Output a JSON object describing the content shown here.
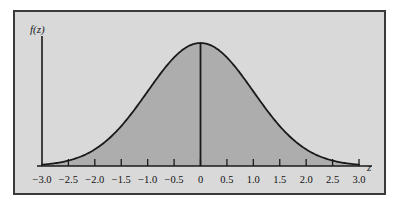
{
  "figure": {
    "background_color": "#d9d9d9",
    "border_color": "#3a3a3a",
    "fill_color": "#adadad",
    "curve_color": "#1a1a1a",
    "axis_color": "#1a1a1a"
  },
  "labels": {
    "y_axis": "f(z)",
    "x_axis": "z"
  },
  "chart_data": {
    "type": "area",
    "title": "",
    "subtitle": "",
    "xlabel": "z",
    "ylabel": "f(z)",
    "xlim": [
      -3.0,
      3.0
    ],
    "ylim": [
      0,
      0.4
    ],
    "grid": false,
    "legend": null,
    "distribution": "standard normal",
    "mean": 0,
    "std_dev": 1,
    "shaded_region": [
      -3.0,
      3.0
    ],
    "annotations": [
      {
        "type": "vertical-line",
        "x": 0,
        "from_y": 0,
        "to_y": 0.3989
      }
    ],
    "xticks": [
      -3.0,
      -2.5,
      -2.0,
      -1.5,
      -1.0,
      -0.5,
      0,
      0.5,
      1.0,
      1.5,
      2.0,
      2.5,
      3.0
    ],
    "xtick_labels": [
      "−3.0",
      "−2.5",
      "−2.0",
      "−1.5",
      "−1.0",
      "−0.5",
      "0",
      "0.5",
      "1.0",
      "1.5",
      "2.0",
      "2.5",
      "3.0"
    ],
    "yticks": [],
    "ytick_labels": [],
    "x": [
      -3.0,
      -2.8,
      -2.6,
      -2.4,
      -2.2,
      -2.0,
      -1.8,
      -1.6,
      -1.4,
      -1.2,
      -1.0,
      -0.8,
      -0.6,
      -0.4,
      -0.2,
      0.0,
      0.2,
      0.4,
      0.6,
      0.8,
      1.0,
      1.2,
      1.4,
      1.6,
      1.8,
      2.0,
      2.2,
      2.4,
      2.6,
      2.8,
      3.0
    ],
    "values": [
      0.0044,
      0.0079,
      0.0136,
      0.0224,
      0.0355,
      0.054,
      0.079,
      0.1109,
      0.1497,
      0.1942,
      0.242,
      0.2897,
      0.3332,
      0.3683,
      0.391,
      0.3989,
      0.391,
      0.3683,
      0.3332,
      0.2897,
      0.242,
      0.1942,
      0.1497,
      0.1109,
      0.079,
      0.054,
      0.0355,
      0.0224,
      0.0136,
      0.0079,
      0.0044
    ]
  }
}
